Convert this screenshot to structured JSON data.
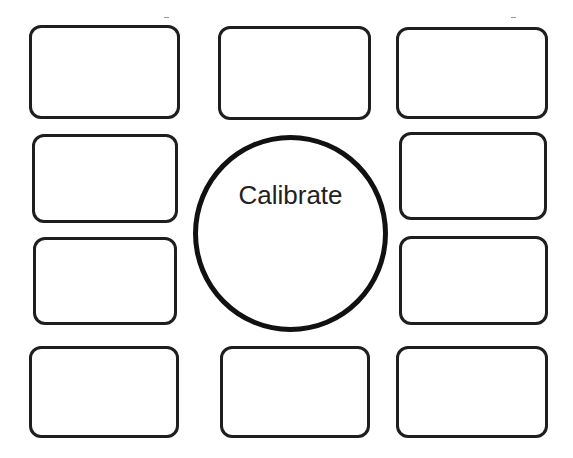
{
  "calibration": {
    "button_label": "Calibrate",
    "stroke_color": "#111111",
    "background": "#ffffff",
    "targets": [
      {
        "id": "top-left",
        "x": 29,
        "y": 25,
        "w": 151,
        "h": 94
      },
      {
        "id": "top-center",
        "x": 218,
        "y": 26,
        "w": 153,
        "h": 94
      },
      {
        "id": "top-right",
        "x": 396,
        "y": 27,
        "w": 152,
        "h": 92
      },
      {
        "id": "upper-middle-left",
        "x": 32,
        "y": 134,
        "w": 146,
        "h": 89
      },
      {
        "id": "upper-middle-right",
        "x": 399,
        "y": 132,
        "w": 148,
        "h": 88
      },
      {
        "id": "lower-middle-left",
        "x": 33,
        "y": 237,
        "w": 144,
        "h": 88
      },
      {
        "id": "lower-middle-right",
        "x": 399,
        "y": 236,
        "w": 149,
        "h": 89
      },
      {
        "id": "bottom-left",
        "x": 29,
        "y": 346,
        "w": 150,
        "h": 92
      },
      {
        "id": "bottom-center",
        "x": 220,
        "y": 346,
        "w": 150,
        "h": 92
      },
      {
        "id": "bottom-right",
        "x": 396,
        "y": 346,
        "w": 152,
        "h": 92
      }
    ]
  }
}
